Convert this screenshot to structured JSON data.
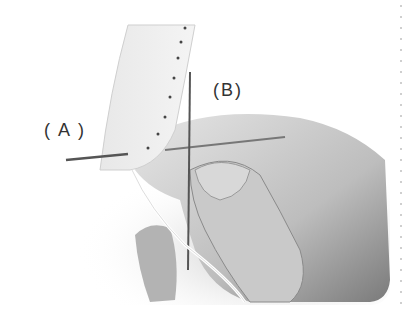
{
  "figure": {
    "labels": {
      "a": "( A )",
      "b": "(B)"
    }
  }
}
